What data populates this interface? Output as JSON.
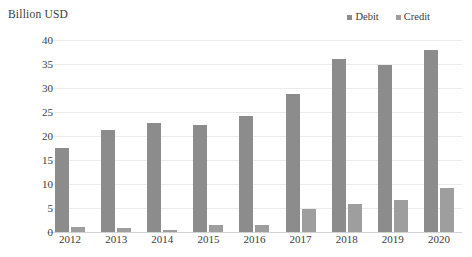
{
  "chart_data": {
    "type": "bar",
    "title": "",
    "ylabel": "Billion USD",
    "xlabel": "",
    "categories": [
      "2012",
      "2013",
      "2014",
      "2015",
      "2016",
      "2017",
      "2018",
      "2019",
      "2020"
    ],
    "series": [
      {
        "name": "Debit",
        "color": "#8c8c8c",
        "values": [
          17.6,
          21.2,
          22.7,
          22.2,
          24.2,
          28.8,
          36.0,
          34.7,
          38.0
        ]
      },
      {
        "name": "Credit",
        "color": "#9e9e9e",
        "values": [
          1.0,
          0.9,
          0.5,
          1.4,
          1.5,
          4.8,
          5.8,
          6.7,
          9.2
        ]
      }
    ],
    "ylim": [
      0,
      40
    ],
    "yticks": [
      0,
      5,
      10,
      15,
      20,
      25,
      30,
      35,
      40
    ],
    "ytick_labels": [
      "0",
      "5",
      "10",
      "15",
      "20",
      "25",
      "30",
      "35",
      "40"
    ],
    "grid": true,
    "legend_position": "top-right",
    "background_color": "#ffffff",
    "gridline_color": "#ebebeb"
  }
}
